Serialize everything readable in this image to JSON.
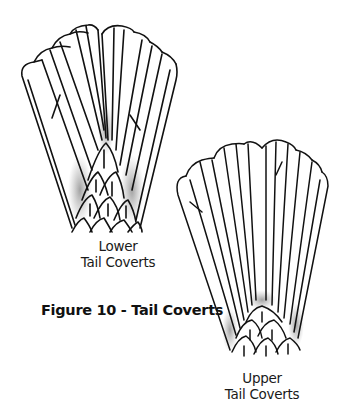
{
  "figure": {
    "caption": "Figure 10 - Tail Coverts",
    "panels": [
      {
        "id": "lower",
        "label_line1": "Lower",
        "label_line2": "Tail Coverts"
      },
      {
        "id": "upper",
        "label_line1": "Upper",
        "label_line2": "Tail Coverts"
      }
    ]
  },
  "colors": {
    "ink": "#111111",
    "shade": "#8a8a8a",
    "background": "#ffffff"
  }
}
